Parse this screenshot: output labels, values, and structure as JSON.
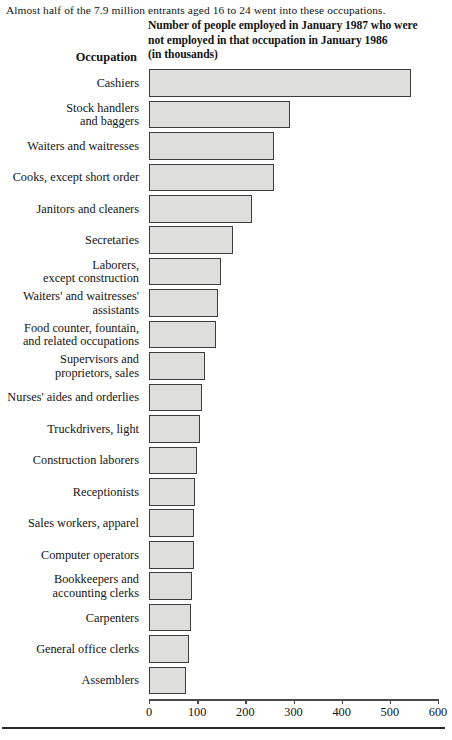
{
  "intro": {
    "text": "Almost half of the 7.9 million entrants aged 16 to 24 went into these occupations."
  },
  "header": {
    "occupation_label": "Occupation",
    "value_header_line1": "Number of people employed in January 1987 who were",
    "value_header_line2": "not employed in that occupation in January 1986",
    "value_header_line3": "(in thousands)"
  },
  "axis": {
    "ticks": [
      "0",
      "100",
      "200",
      "300",
      "400",
      "500",
      "600"
    ],
    "min": 0,
    "max": 600
  },
  "colors": {
    "bar_fill": "#dededc",
    "bar_stroke": "#3d3d3d",
    "text": "#141414",
    "axis": "#4a4a4a"
  },
  "chart_data": {
    "type": "bar",
    "orientation": "horizontal",
    "title": "Number of people employed in January 1987 who were not employed in that occupation in January 1986 (in thousands)",
    "subtitle": "Almost half of the 7.9 million entrants aged 16 to 24 went into these occupations.",
    "xlabel": "",
    "ylabel": "Occupation",
    "xlim": [
      0,
      600
    ],
    "xticks": [
      0,
      100,
      200,
      300,
      400,
      500,
      600
    ],
    "grid": false,
    "legend": false,
    "units": "thousands",
    "categories": [
      "Cashiers",
      "Stock handlers and baggers",
      "Waiters and waitresses",
      "Cooks, except short order",
      "Janitors and cleaners",
      "Secretaries",
      "Laborers, except construction",
      "Waiters' and waitresses' assistants",
      "Food counter, fountain, and related occupations",
      "Supervisors and proprietors, sales",
      "Nurses' aides and orderlies",
      "Truckdrivers, light",
      "Construction laborers",
      "Receptionists",
      "Sales workers, apparel",
      "Computer operators",
      "Bookkeepers and accounting clerks",
      "Carpenters",
      "General office clerks",
      "Assemblers"
    ],
    "values": [
      544,
      293,
      260,
      259,
      213,
      174,
      150,
      144,
      140,
      117,
      109,
      105,
      100,
      95,
      94,
      93,
      90,
      88,
      84,
      76
    ]
  },
  "rows": [
    {
      "lines": [
        "Cashiers"
      ],
      "value": 544
    },
    {
      "lines": [
        "Stock handlers",
        "and baggers"
      ],
      "value": 293
    },
    {
      "lines": [
        "Waiters and waitresses"
      ],
      "value": 260
    },
    {
      "lines": [
        "Cooks, except short order"
      ],
      "value": 259
    },
    {
      "lines": [
        "Janitors and cleaners"
      ],
      "value": 213
    },
    {
      "lines": [
        "Secretaries"
      ],
      "value": 174
    },
    {
      "lines": [
        "Laborers,",
        "except construction"
      ],
      "value": 150
    },
    {
      "lines": [
        "Waiters' and waitresses'",
        "assistants"
      ],
      "value": 144
    },
    {
      "lines": [
        "Food counter, fountain,",
        "and related occupations"
      ],
      "value": 140
    },
    {
      "lines": [
        "Supervisors and",
        "proprietors, sales"
      ],
      "value": 117
    },
    {
      "lines": [
        "Nurses' aides and orderlies"
      ],
      "value": 109
    },
    {
      "lines": [
        "Truckdrivers, light"
      ],
      "value": 105
    },
    {
      "lines": [
        "Construction laborers"
      ],
      "value": 100
    },
    {
      "lines": [
        "Receptionists"
      ],
      "value": 95
    },
    {
      "lines": [
        "Sales workers, apparel"
      ],
      "value": 94
    },
    {
      "lines": [
        "Computer operators"
      ],
      "value": 93
    },
    {
      "lines": [
        "Bookkeepers and",
        "accounting clerks"
      ],
      "value": 90
    },
    {
      "lines": [
        "Carpenters"
      ],
      "value": 88
    },
    {
      "lines": [
        "General office clerks"
      ],
      "value": 84
    },
    {
      "lines": [
        "Assemblers"
      ],
      "value": 76
    }
  ]
}
